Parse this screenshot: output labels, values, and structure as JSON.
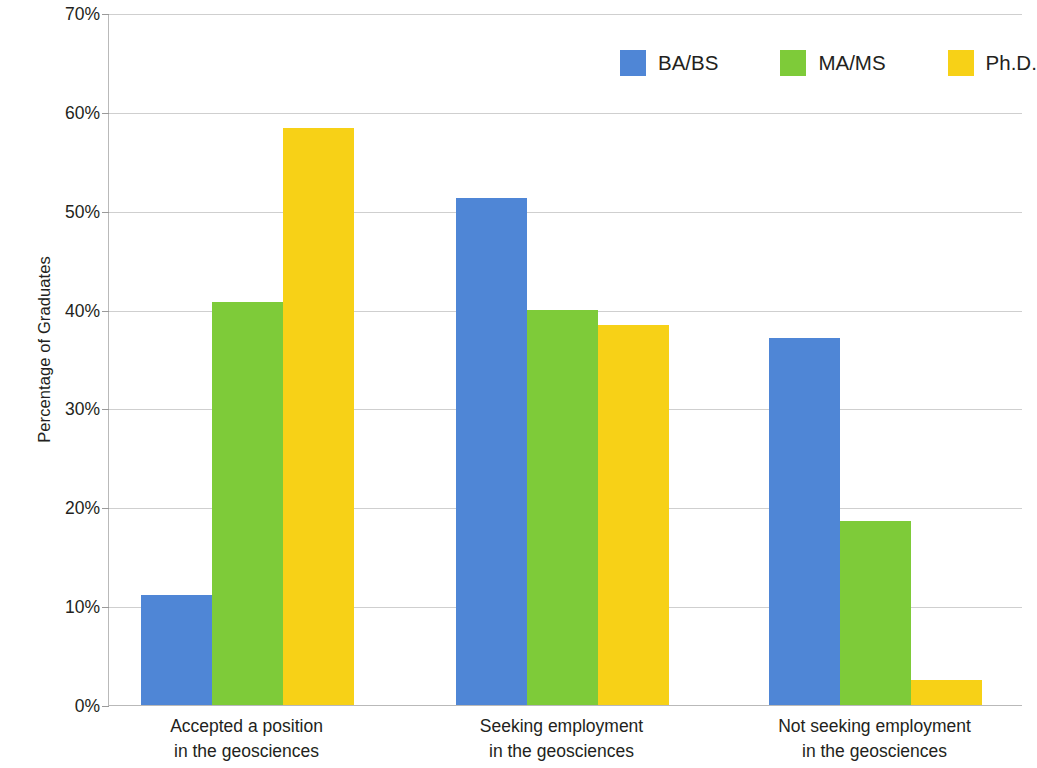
{
  "chart_data": {
    "type": "bar",
    "title": "",
    "xlabel": "",
    "ylabel": "Percentage of Graduates",
    "ylim": [
      0,
      70
    ],
    "ytick_step": 10,
    "ytick_labels": [
      "70%",
      "60%",
      "50%",
      "40%",
      "30%",
      "20%",
      "10%",
      "0%"
    ],
    "ytick_values": [
      70,
      60,
      50,
      40,
      30,
      20,
      10,
      0
    ],
    "grid": true,
    "legend_position": "top-right",
    "categories": [
      "Accepted a position in the geosciences",
      "Seeking employment in the geosciences",
      "Not seeking employment in the geosciences"
    ],
    "category_label_lines": [
      [
        "Accepted a position",
        "in the geosciences"
      ],
      [
        "Seeking employment",
        "in the geosciences"
      ],
      [
        "Not seeking employment",
        "in the geosciences"
      ]
    ],
    "series": [
      {
        "name": "BA/BS",
        "color": "#4f86d6",
        "values": [
          11.1,
          51.3,
          37.1
        ]
      },
      {
        "name": "MA/MS",
        "color": "#7ecb39",
        "values": [
          40.8,
          40.0,
          18.6
        ]
      },
      {
        "name": "Ph.D.",
        "color": "#f7d117",
        "values": [
          58.4,
          38.4,
          2.5
        ]
      }
    ]
  },
  "legend": {
    "items": [
      {
        "label": "BA/BS",
        "color": "#4f86d6"
      },
      {
        "label": "MA/MS",
        "color": "#7ecb39"
      },
      {
        "label": "Ph.D.",
        "color": "#f7d117"
      }
    ]
  },
  "axes": {
    "y_title": "Percentage of Graduates",
    "y_ticks": [
      "70%",
      "60%",
      "50%",
      "40%",
      "30%",
      "20%",
      "10%",
      "0%"
    ]
  },
  "colors": {
    "ba_bs": "#4f86d6",
    "ma_ms": "#7ecb39",
    "phd": "#f7d117",
    "gridline": "#cfcfcf",
    "axis": "#b9b9b9",
    "text": "#231f20",
    "background": "#ffffff"
  }
}
